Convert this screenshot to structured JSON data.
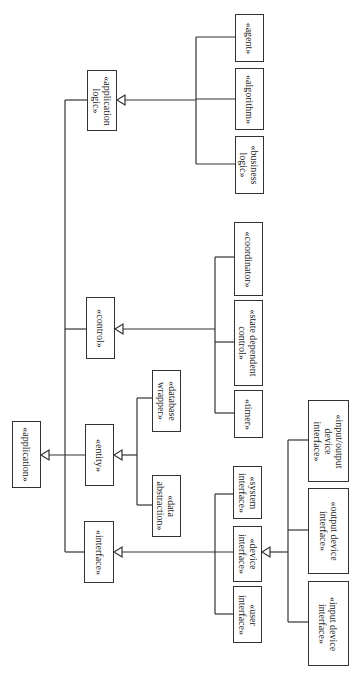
{
  "diagram": {
    "type": "UML stereotype generalization hierarchy (rotated 90°)",
    "root": {
      "id": "application",
      "label": "«application»"
    },
    "nodes": {
      "application": "«application»",
      "application_logic": "«application\nlogic»",
      "control": "«control»",
      "entity": "«entity»",
      "interface": "«interface»",
      "agent": "«agent»",
      "algorithm": "«algorithm»",
      "business_logic": "«business\nlogic»",
      "coordinator": "«coordinator»",
      "state_dependent_control": "«state dependent\ncontrol»",
      "timer": "«timer»",
      "database_wrapper": "«database\nwrapper»",
      "data_abstraction": "«data\nabstraction»",
      "system_interface": "«system\ninterface»",
      "device_interface": "«device\ninterface»",
      "user_interface": "«user\ninterface»",
      "io_device_interface": "«input/output\ndevice\ninterface»",
      "output_device_interface": "«output device\ninterface»",
      "input_device_interface": "«input device\ninterface»"
    },
    "edges": [
      {
        "child": "application_logic",
        "parent": "application",
        "kind": "generalization"
      },
      {
        "child": "control",
        "parent": "application",
        "kind": "generalization"
      },
      {
        "child": "entity",
        "parent": "application",
        "kind": "generalization"
      },
      {
        "child": "interface",
        "parent": "application",
        "kind": "generalization"
      },
      {
        "child": "agent",
        "parent": "application_logic",
        "kind": "generalization"
      },
      {
        "child": "algorithm",
        "parent": "application_logic",
        "kind": "generalization"
      },
      {
        "child": "business_logic",
        "parent": "application_logic",
        "kind": "generalization"
      },
      {
        "child": "coordinator",
        "parent": "control",
        "kind": "generalization"
      },
      {
        "child": "state_dependent_control",
        "parent": "control",
        "kind": "generalization"
      },
      {
        "child": "timer",
        "parent": "control",
        "kind": "generalization"
      },
      {
        "child": "database_wrapper",
        "parent": "entity",
        "kind": "generalization"
      },
      {
        "child": "data_abstraction",
        "parent": "entity",
        "kind": "generalization"
      },
      {
        "child": "system_interface",
        "parent": "interface",
        "kind": "generalization"
      },
      {
        "child": "device_interface",
        "parent": "interface",
        "kind": "generalization"
      },
      {
        "child": "user_interface",
        "parent": "interface",
        "kind": "generalization"
      },
      {
        "child": "io_device_interface",
        "parent": "device_interface",
        "kind": "generalization"
      },
      {
        "child": "output_device_interface",
        "parent": "device_interface",
        "kind": "generalization"
      },
      {
        "child": "input_device_interface",
        "parent": "device_interface",
        "kind": "generalization"
      }
    ],
    "colors": {
      "line": "#333333",
      "box_border": "#333333",
      "background": "#ffffff"
    }
  }
}
